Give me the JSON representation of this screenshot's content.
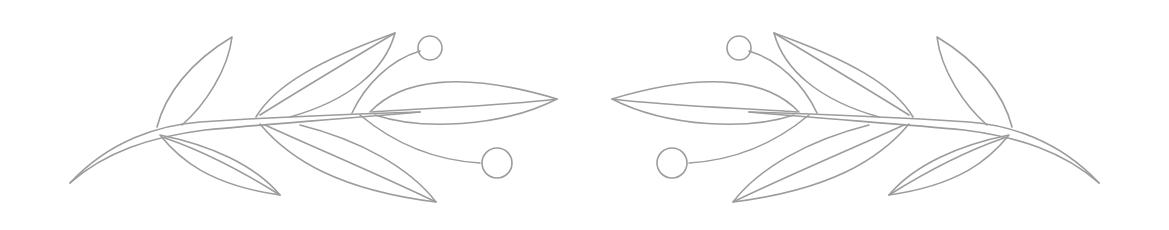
{
  "illustration": {
    "description": "Hand-drawn pencil olive/laurel branch divider, mirrored pair",
    "stroke_color": "#9c9c9c",
    "background": "#ffffff",
    "branches": [
      {
        "side": "left",
        "leaves": 6,
        "berries": 2
      },
      {
        "side": "right",
        "leaves": 6,
        "berries": 2
      }
    ]
  }
}
